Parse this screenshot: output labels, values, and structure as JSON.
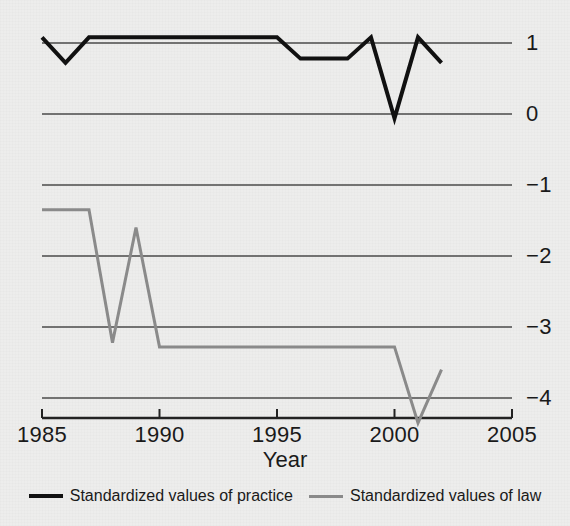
{
  "chart_data": {
    "type": "line",
    "title": "",
    "xlabel": "Year",
    "ylabel": "",
    "xlim": [
      1985,
      2005
    ],
    "ylim": [
      -4.5,
      1.35
    ],
    "grid": true,
    "grid_axis": "y",
    "legend_position": "bottom",
    "y_axis_side": "right",
    "xticks": [
      1985,
      1990,
      1995,
      2000,
      2005
    ],
    "xtick_labels": [
      "1985",
      "1990",
      "1995",
      "2000",
      "2005"
    ],
    "yticks": [
      1,
      0,
      -1,
      -2,
      -3,
      -4
    ],
    "ytick_labels": [
      "1",
      "0",
      "−1",
      "−2",
      "−3",
      "−4"
    ],
    "x": [
      1985,
      1986,
      1987,
      1988,
      1989,
      1990,
      1991,
      1992,
      1993,
      1994,
      1995,
      1996,
      1997,
      1998,
      1999,
      2000,
      2001,
      2002
    ],
    "series": [
      {
        "name": "Standardized values of practice",
        "color": "#111111",
        "width": 4,
        "values": [
          1.08,
          0.72,
          1.08,
          1.08,
          1.08,
          1.08,
          1.08,
          1.08,
          1.08,
          1.08,
          1.08,
          0.78,
          0.78,
          0.78,
          1.08,
          -0.06,
          1.08,
          0.72
        ]
      },
      {
        "name": "Standardized values of law",
        "color": "#8a8a8a",
        "width": 3,
        "values": [
          -1.35,
          -1.35,
          -1.35,
          -3.22,
          -1.6,
          -3.28,
          -3.28,
          -3.28,
          -3.28,
          -3.28,
          -3.28,
          -3.28,
          -3.28,
          -3.28,
          -3.28,
          -3.28,
          -4.35,
          -3.6
        ]
      }
    ]
  },
  "axis": {
    "x_title": "Year"
  },
  "legend": {
    "items": [
      {
        "label": "Standardized values of practice",
        "style": "practice"
      },
      {
        "label": "Standardized values of law",
        "style": "law"
      }
    ]
  },
  "colors": {
    "practice": "#111111",
    "law": "#8a8a8a",
    "axis": "#222222",
    "grid": "#4a4a4a",
    "background": "#ededec"
  }
}
